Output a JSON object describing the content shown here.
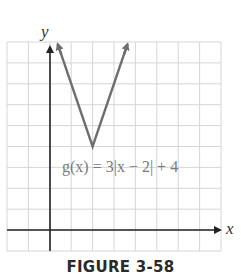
{
  "figure": {
    "caption": "FIGURE 3-58",
    "equation_label": "g(x) = 3|x − 2| + 4",
    "x_axis_label": "x",
    "y_axis_label": "y"
  },
  "colors": {
    "grid": "#d4d4d4",
    "axis": "#222222",
    "curve": "#6e6e6e",
    "label": "#7a7a7a"
  },
  "chart_data": {
    "type": "line",
    "title": "FIGURE 3-58",
    "xlabel": "x",
    "ylabel": "y",
    "xlim": [
      -2,
      8
    ],
    "ylim": [
      -1,
      9
    ],
    "grid": true,
    "legend": null,
    "annotations": [
      "g(x) = 3|x − 2| + 4"
    ],
    "series": [
      {
        "name": "g(x) = 3|x − 2| + 4",
        "function": "3*abs(x-2)+4",
        "x": [
          0.37,
          2,
          3.63
        ],
        "y": [
          8.9,
          4,
          8.9
        ],
        "vertex": [
          2,
          4
        ],
        "arrows_at_ends": true
      }
    ]
  }
}
